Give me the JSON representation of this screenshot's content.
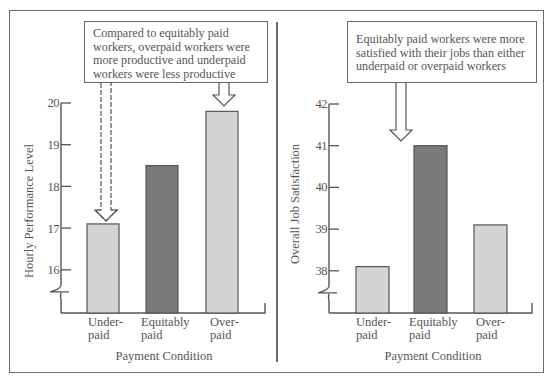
{
  "chart_data": [
    {
      "type": "bar",
      "title": "",
      "annotation": "Compared to equitably paid workers, overpaid workers were more productive and underpaid workers were less productive",
      "annotation_lines": [
        "Compared to equitably paid",
        "workers, overpaid workers were",
        "more productive and underpaid",
        "workers were less productive"
      ],
      "categories": [
        "Under-paid",
        "Equitably paid",
        "Over-paid"
      ],
      "category_lines": [
        [
          "Under-",
          "paid"
        ],
        [
          "Equitably",
          "paid"
        ],
        [
          "Over-",
          "paid"
        ]
      ],
      "values": [
        17.1,
        18.5,
        19.8
      ],
      "bar_colors": [
        "#d4d4d4",
        "#7a7a7a",
        "#d4d4d4"
      ],
      "xlabel": "Payment Condition",
      "ylabel": "Hourly Performance Level",
      "yticks": [
        16,
        17,
        18,
        19,
        20
      ],
      "ylim": [
        15.5,
        20
      ],
      "axis_break": true,
      "grid": false,
      "legend": null
    },
    {
      "type": "bar",
      "title": "",
      "annotation": "Equitably paid workers were more satisfied with their jobs than either underpaid or overpaid workers",
      "annotation_lines": [
        "Equitably paid workers were more",
        "satisfied with their jobs than either",
        "underpaid or overpaid workers"
      ],
      "categories": [
        "Under-paid",
        "Equitably paid",
        "Over-paid"
      ],
      "category_lines": [
        [
          "Under-",
          "paid"
        ],
        [
          "Equitably",
          "paid"
        ],
        [
          "Over-",
          "paid"
        ]
      ],
      "values": [
        38.1,
        41.0,
        39.1
      ],
      "bar_colors": [
        "#d4d4d4",
        "#7a7a7a",
        "#d4d4d4"
      ],
      "xlabel": "Payment Condition",
      "ylabel": "Overall Job Satisfaction",
      "yticks": [
        38,
        39,
        40,
        41,
        42
      ],
      "ylim": [
        37.5,
        42
      ],
      "axis_break": true,
      "grid": false,
      "legend": null
    }
  ],
  "colors": {
    "light_bar": "#d4d4d4",
    "dark_bar": "#7a7a7a",
    "outline": "#555555",
    "frame": "#6a6a6a"
  }
}
